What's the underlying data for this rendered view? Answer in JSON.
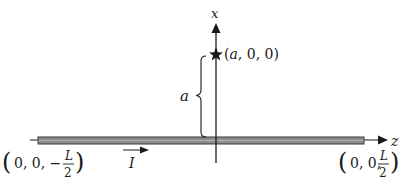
{
  "diagram": {
    "axes": {
      "x_label": "x",
      "z_label": "z"
    },
    "point": {
      "marker": "star-icon",
      "label_open": "(",
      "label_var": "a",
      "label_rest": ", 0, 0)"
    },
    "distance": {
      "label": "a",
      "marker": "curly-brace"
    },
    "current": {
      "label": "I",
      "direction": "+z"
    },
    "wire_ends": {
      "left": {
        "prefix": "0, 0, −",
        "num": "L",
        "den": "2"
      },
      "right": {
        "prefix": "0, 0,",
        "num": "L",
        "den": "2"
      }
    },
    "colors": {
      "wire_fill": "#8c8c8c",
      "wire_stroke": "#3a3a3a",
      "line": "#1a1a1a"
    }
  }
}
